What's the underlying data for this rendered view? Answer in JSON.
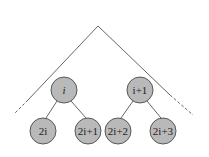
{
  "diagram": {
    "type": "binary-tree-heap-indexing",
    "colors": {
      "node_fill": "#b9b9b9",
      "node_stroke": "#4a4a4a",
      "edge": "#555555",
      "background": "#ffffff"
    },
    "root_apex": {
      "x": 98,
      "y": 26
    },
    "outline": {
      "left": {
        "solid_to": {
          "x": 28,
          "y": 100
        },
        "dashed_to": {
          "x": 14,
          "y": 114
        }
      },
      "right": {
        "solid_to": {
          "x": 170,
          "y": 95
        },
        "dashed_to": {
          "x": 193,
          "y": 115
        }
      }
    },
    "nodes": [
      {
        "id": "i",
        "label": "i",
        "x": 64,
        "y": 90,
        "r": 13
      },
      {
        "id": "i+1",
        "label": "i+1",
        "x": 140,
        "y": 90,
        "r": 13
      },
      {
        "id": "2i",
        "label": "2i",
        "x": 43,
        "y": 131,
        "r": 13
      },
      {
        "id": "2i+1",
        "label": "2i+1",
        "x": 88,
        "y": 131,
        "r": 13
      },
      {
        "id": "2i+2",
        "label": "2i+2",
        "x": 118,
        "y": 131,
        "r": 13
      },
      {
        "id": "2i+3",
        "label": "2i+3",
        "x": 163,
        "y": 131,
        "r": 13
      }
    ],
    "edges": [
      {
        "from": "i",
        "to": "2i"
      },
      {
        "from": "i",
        "to": "2i+1"
      },
      {
        "from": "i+1",
        "to": "2i+2"
      },
      {
        "from": "i+1",
        "to": "2i+3"
      }
    ]
  }
}
